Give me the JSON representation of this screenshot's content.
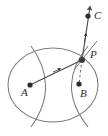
{
  "figure": {
    "title": "",
    "width": 108,
    "height": 136,
    "background": "#ffffff",
    "stroke_color": "#6d6d6d",
    "dark_stroke_color": "#4a4a4a",
    "point_color": "#2b2b2b",
    "label_color": "#2b2b2b",
    "points": [
      {
        "id": "A",
        "label": "A",
        "x": 30,
        "y": 85,
        "label_x": 21,
        "label_y": 96,
        "role": "focus-left"
      },
      {
        "id": "B",
        "label": "B",
        "x": 79,
        "y": 84,
        "label_x": 80,
        "label_y": 97,
        "role": "focus-right"
      },
      {
        "id": "P",
        "label": "P",
        "x": 82,
        "y": 60,
        "label_x": 90,
        "label_y": 58,
        "role": "intersection"
      },
      {
        "id": "C",
        "label": "C",
        "x": 88,
        "y": 16,
        "label_x": 94,
        "label_y": 19,
        "role": "ray-point"
      }
    ],
    "curves": [
      {
        "id": "ellipse",
        "kind": "ellipse",
        "cx": 53,
        "cy": 85,
        "rx": 45,
        "ry": 37
      },
      {
        "id": "hyperbola-left",
        "kind": "hyperbola-branch",
        "opens": "left"
      },
      {
        "id": "hyperbola-right",
        "kind": "hyperbola-branch",
        "opens": "right"
      }
    ],
    "segments": [
      {
        "id": "ray-A-P-C",
        "from": "A",
        "through": "P",
        "to": "C",
        "style": "solid",
        "arrow": "end",
        "midpoint_arrow": true
      },
      {
        "id": "dashed-P-B",
        "from": "P",
        "to": "B",
        "style": "dashed",
        "arrow": "none"
      },
      {
        "id": "tangent-at-P",
        "from": "P",
        "to": "tangent-end",
        "style": "solid",
        "arrow": "none"
      }
    ],
    "notes": {
      "caption": "",
      "icon_arrow": "arrow-head"
    }
  }
}
